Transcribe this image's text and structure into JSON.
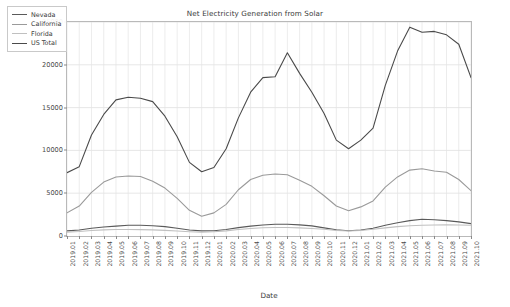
{
  "chart_data": {
    "type": "line",
    "title": "Net Electricity Generation from Solar",
    "xlabel": "Date",
    "ylabel": "GWh",
    "ylim": [
      0,
      25000
    ],
    "yticks": [
      0,
      5000,
      10000,
      15000,
      20000,
      25000
    ],
    "grid": true,
    "legend_position": "upper-left",
    "x": [
      "2019.01",
      "2019.02",
      "2019.03",
      "2019.04",
      "2019.05",
      "2019.06",
      "2019.07",
      "2019.08",
      "2019.09",
      "2019.10",
      "2019.11",
      "2019.12",
      "2020.01",
      "2020.02",
      "2020.03",
      "2020.04",
      "2020.05",
      "2020.06",
      "2020.07",
      "2020.08",
      "2020.09",
      "2020.10",
      "2020.11",
      "2020.12",
      "2021.01",
      "2021.02",
      "2021.03",
      "2021.04",
      "2021.05",
      "2021.06",
      "2021.07",
      "2021.08",
      "2021.09",
      "2021.10"
    ],
    "series": [
      {
        "name": "Nevada",
        "color": "#5a5a5a",
        "values": [
          600,
          700,
          900,
          1050,
          1150,
          1250,
          1250,
          1200,
          1100,
          900,
          700,
          600,
          620,
          760,
          980,
          1150,
          1280,
          1380,
          1380,
          1300,
          1180,
          950,
          730,
          620,
          700,
          900,
          1250,
          1550,
          1800,
          1950,
          1900,
          1800,
          1650,
          1450
        ]
      },
      {
        "name": "California",
        "color": "#9a9a9a",
        "values": [
          2700,
          3500,
          5100,
          6300,
          6900,
          7000,
          6950,
          6400,
          5600,
          4400,
          3000,
          2300,
          2700,
          3700,
          5400,
          6600,
          7100,
          7250,
          7150,
          6500,
          5800,
          4700,
          3500,
          2950,
          3400,
          4100,
          5700,
          6900,
          7700,
          7850,
          7600,
          7450,
          6600,
          5300
        ]
      },
      {
        "name": "Florida",
        "color": "#c0c0c0",
        "values": [
          450,
          520,
          640,
          720,
          760,
          760,
          740,
          720,
          660,
          580,
          500,
          450,
          500,
          600,
          760,
          880,
          960,
          1000,
          990,
          950,
          880,
          780,
          650,
          580,
          650,
          780,
          950,
          1100,
          1200,
          1260,
          1280,
          1300,
          1280,
          1250
        ]
      },
      {
        "name": "US Total",
        "color": "#4a4a4a",
        "values": [
          7400,
          8100,
          11800,
          14200,
          15900,
          16200,
          16100,
          15700,
          14000,
          11600,
          8600,
          7500,
          8000,
          10200,
          13800,
          16800,
          18500,
          18600,
          21400,
          19000,
          16800,
          14300,
          11200,
          10200,
          11200,
          12600,
          17600,
          21600,
          24400,
          23800,
          23900,
          23500,
          22400,
          18500
        ]
      }
    ]
  },
  "legend": {
    "items": [
      {
        "label": "Nevada"
      },
      {
        "label": "California"
      },
      {
        "label": "Florida"
      },
      {
        "label": "US Total"
      }
    ]
  }
}
